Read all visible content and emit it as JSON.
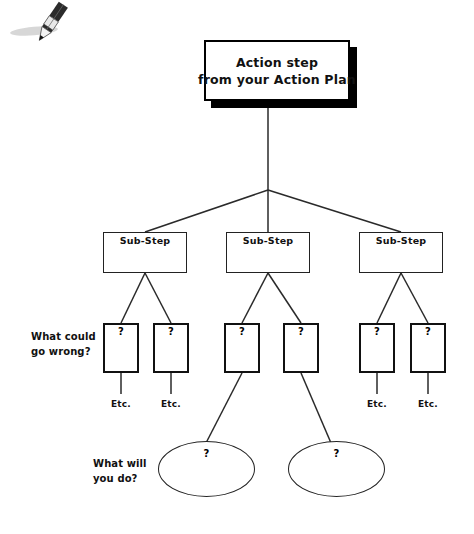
{
  "diagram": {
    "title_box": {
      "line1": "Action step",
      "line2": "from your Action Plan"
    },
    "substeps": [
      {
        "label": "Sub-Step"
      },
      {
        "label": "Sub-Step"
      },
      {
        "label": "Sub-Step"
      }
    ],
    "question_boxes": [
      {
        "mark": "?"
      },
      {
        "mark": "?"
      },
      {
        "mark": "?"
      },
      {
        "mark": "?"
      },
      {
        "mark": "?"
      },
      {
        "mark": "?"
      }
    ],
    "etc_labels": [
      {
        "text": "Etc."
      },
      {
        "text": "Etc."
      },
      {
        "text": "Etc."
      },
      {
        "text": "Etc."
      }
    ],
    "ovals": [
      {
        "mark": "?"
      },
      {
        "mark": "?"
      }
    ],
    "prompts": {
      "what_could_go_wrong": {
        "line1": "What could",
        "line2": "go wrong?"
      },
      "what_will_you_do": {
        "line1": "What will",
        "line2": "you do?"
      }
    },
    "icons": {
      "pencil": "pencil-icon"
    },
    "colors": {
      "ink": "#111111",
      "line": "#222222",
      "shadow": "#000000",
      "background": "#ffffff"
    }
  }
}
